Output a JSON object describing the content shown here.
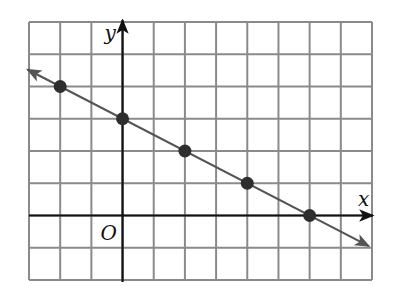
{
  "chart_data": {
    "type": "line",
    "title": "",
    "xlabel": "x",
    "ylabel": "y",
    "origin_label": "O",
    "xlim": [
      -3,
      8
    ],
    "ylim": [
      -2,
      6
    ],
    "grid": true,
    "grid_step": 1,
    "tick_labels": false,
    "series": [
      {
        "name": "line",
        "equation": "y = -x/2 + 3",
        "slope": -0.5,
        "intercept": 3,
        "arrows_both_ends": true,
        "x": [
          -2,
          0,
          2,
          4,
          6
        ],
        "y": [
          4,
          3,
          2,
          1,
          0
        ]
      }
    ]
  },
  "colors": {
    "grid": "#8a8a8a",
    "axes": "#111111",
    "line": "#555555",
    "points": "#2e2e2e"
  }
}
